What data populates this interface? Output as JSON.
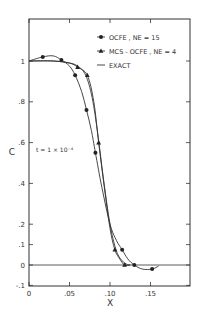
{
  "chart_data": {
    "type": "line",
    "title": "",
    "xlabel": "X",
    "ylabel": "C",
    "xlim": [
      0,
      0.2
    ],
    "ylim": [
      -0.1,
      1.1
    ],
    "grid": false,
    "legend_position": "upper right",
    "x_ticks": [
      "0",
      ".05",
      ".10",
      ".15"
    ],
    "x_tick_values": [
      0,
      0.05,
      0.1,
      0.15
    ],
    "y_ticks": [
      "-.1",
      "0",
      ".1",
      ".2",
      ".4",
      ".6",
      ".8",
      "1"
    ],
    "y_tick_values": [
      -0.1,
      0,
      0.1,
      0.2,
      0.4,
      0.6,
      0.8,
      1.0
    ],
    "annotations": [
      {
        "text": "t = 1 × 10⁻⁴",
        "x": 0.005,
        "y": 0.55
      }
    ],
    "series": [
      {
        "name": "OCFE , NE = 15",
        "marker": "circle",
        "x": [
          0.017,
          0.04,
          0.057,
          0.071,
          0.082,
          0.115,
          0.13,
          0.152
        ],
        "y": [
          1.02,
          1.005,
          0.93,
          0.76,
          0.55,
          0.075,
          0.0,
          -0.02
        ],
        "curve_x": [
          0.0,
          0.017,
          0.03,
          0.04,
          0.05,
          0.057,
          0.065,
          0.071,
          0.077,
          0.082,
          0.09,
          0.1,
          0.108,
          0.115,
          0.122,
          0.13,
          0.14,
          0.152,
          0.16
        ],
        "curve_y": [
          1.0,
          1.02,
          1.025,
          1.005,
          0.975,
          0.93,
          0.85,
          0.76,
          0.66,
          0.55,
          0.38,
          0.2,
          0.12,
          0.075,
          0.03,
          0.0,
          -0.02,
          -0.02,
          -0.005
        ]
      },
      {
        "name": "MCS - OCFE , NE = 4",
        "marker": "triangle",
        "x": [
          0.06,
          0.072,
          0.086,
          0.106,
          0.118
        ],
        "y": [
          0.97,
          0.93,
          0.6,
          0.075,
          0.0
        ],
        "curve_x": [
          0.0,
          0.03,
          0.05,
          0.06,
          0.072,
          0.08,
          0.086,
          0.093,
          0.1,
          0.106,
          0.112,
          0.118,
          0.125
        ],
        "curve_y": [
          1.0,
          1.0,
          0.99,
          0.97,
          0.93,
          0.8,
          0.6,
          0.38,
          0.18,
          0.075,
          0.03,
          0.0,
          0.0
        ]
      },
      {
        "name": "EXACT",
        "marker": "none",
        "curve_x": [
          0.0,
          0.03,
          0.05,
          0.06,
          0.07,
          0.078,
          0.085,
          0.092,
          0.1,
          0.107,
          0.113,
          0.12,
          0.125
        ],
        "curve_y": [
          1.0,
          1.0,
          0.99,
          0.975,
          0.93,
          0.82,
          0.64,
          0.42,
          0.2,
          0.08,
          0.03,
          0.005,
          0.0
        ]
      }
    ]
  },
  "legend": [
    {
      "label": "OCFE , NE = 15",
      "marker": "circle"
    },
    {
      "label": "MCS - OCFE , NE = 4",
      "marker": "triangle"
    },
    {
      "label": "EXACT",
      "marker": "none"
    }
  ],
  "axis": {
    "xlabel": "X",
    "ylabel": "C",
    "annotation": "t = 1 × 10⁻⁴"
  }
}
